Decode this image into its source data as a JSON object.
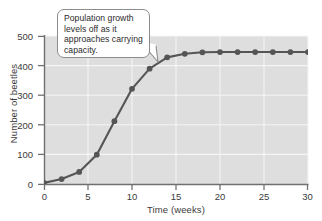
{
  "chart_data": {
    "type": "line",
    "title": "",
    "xlabel": "Time (weeks)",
    "ylabel": "Number of beetles",
    "xlim": [
      0,
      30
    ],
    "ylim": [
      0,
      500
    ],
    "xticks": [
      0,
      5,
      10,
      15,
      20,
      25,
      30
    ],
    "yticks": [
      0,
      100,
      200,
      300,
      400,
      500
    ],
    "grid": true,
    "legend": "none",
    "series": [
      {
        "name": "Beetle population",
        "color": "#555555",
        "marker": "circle",
        "x": [
          0,
          2,
          4,
          6,
          8,
          10,
          12,
          14,
          16,
          18,
          20,
          22,
          24,
          26,
          28,
          30
        ],
        "values": [
          5,
          18,
          42,
          100,
          213,
          322,
          390,
          428,
          440,
          445,
          446,
          446,
          446,
          446,
          446,
          446
        ]
      }
    ],
    "annotations": [
      {
        "name": "carrying-capacity-callout",
        "text": "Population growth levels off as it approaches carrying capacity.",
        "points_to_x": 15,
        "points_to_y": 440
      }
    ]
  },
  "axes": {
    "x_label": "Time (weeks)",
    "y_label": "Number of beetles",
    "x_tick_labels": [
      "0",
      "5",
      "10",
      "15",
      "20",
      "25",
      "30"
    ],
    "y_tick_labels": [
      "0",
      "100",
      "200",
      "300",
      "400",
      "500"
    ]
  },
  "callout": {
    "text": "Population growth levels off as it approaches carrying capacity."
  },
  "colors": {
    "plot_background": "#dedede",
    "gridline": "#f5f5f5",
    "line": "#555555",
    "axis": "#707070",
    "text": "#3b3b3b",
    "callout_border": "#8c8c8c",
    "callout_fill": "#ffffff"
  }
}
